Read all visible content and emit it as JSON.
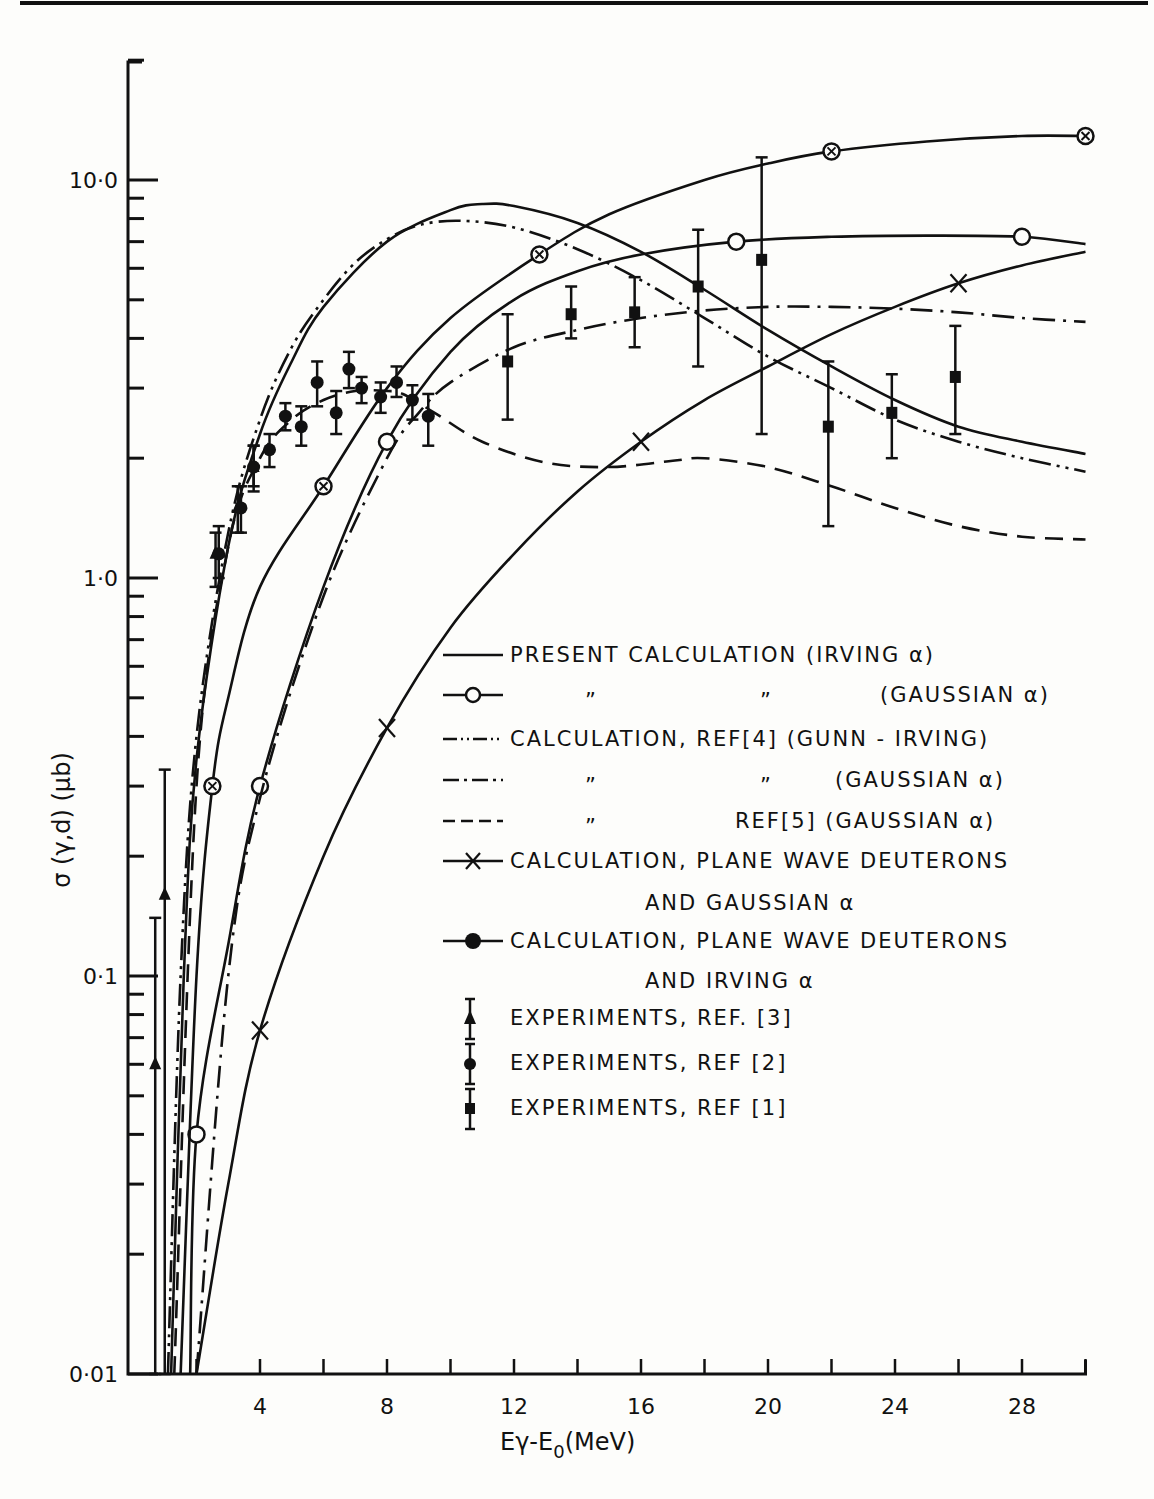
{
  "chart_data": {
    "type": "line",
    "title": "",
    "xlabel": "Eγ-E₀ (MeV)",
    "ylabel": "σ (γ,d) (μb)",
    "xscale": "linear",
    "yscale": "log",
    "xlim": [
      0,
      30
    ],
    "ylim": [
      0.01,
      20
    ],
    "x_ticks": [
      4,
      8,
      12,
      16,
      20,
      24,
      28
    ],
    "x_tick_labels": [
      "4",
      "8",
      "12",
      "16",
      "20",
      "24",
      "28"
    ],
    "y_ticks": [
      0.01,
      0.1,
      1.0,
      10.0
    ],
    "y_tick_labels": [
      "0·01",
      "0·1",
      "1·0",
      "10·0"
    ],
    "grid": false,
    "legend_position": "center-right",
    "series": [
      {
        "name": "PRESENT CALCULATION (IRVING α)",
        "style": "solid",
        "marker": "none",
        "x": [
          1.2,
          1.6,
          2,
          3,
          4,
          5,
          6,
          8,
          10,
          11,
          12,
          14,
          16,
          18,
          20,
          22,
          24,
          26,
          28,
          30
        ],
        "y": [
          0.01,
          0.1,
          0.35,
          1.2,
          2.3,
          3.5,
          4.8,
          7.0,
          8.4,
          8.7,
          8.6,
          7.8,
          6.6,
          5.3,
          4.2,
          3.4,
          2.8,
          2.4,
          2.2,
          2.05
        ]
      },
      {
        "name": "PRESENT CALCULATION (GAUSSIAN α)",
        "style": "solid",
        "marker": "open-circle",
        "x": [
          1.8,
          2,
          3,
          4,
          6,
          8,
          10,
          12,
          14,
          16,
          19,
          22,
          25,
          28,
          30
        ],
        "y": [
          0.01,
          0.04,
          0.12,
          0.3,
          0.95,
          2.2,
          3.7,
          5.0,
          5.9,
          6.5,
          7.0,
          7.2,
          7.25,
          7.2,
          6.9
        ],
        "marker_points": [
          [
            2,
            0.04
          ],
          [
            4,
            0.3
          ],
          [
            8,
            2.2
          ],
          [
            19,
            7.0
          ],
          [
            28,
            7.2
          ]
        ]
      },
      {
        "name": "CALCULATION, REF[4] (GUNN-IRVING)",
        "style": "dash-dot-dot",
        "marker": "none",
        "x": [
          1.1,
          1.5,
          2,
          3,
          4,
          5,
          6,
          7,
          8,
          9,
          10.3,
          12,
          14,
          16,
          18,
          20,
          22,
          24,
          26,
          28,
          30
        ],
        "y": [
          0.01,
          0.1,
          0.4,
          1.3,
          2.5,
          3.8,
          5.0,
          6.2,
          7.1,
          7.7,
          7.9,
          7.6,
          6.7,
          5.6,
          4.5,
          3.6,
          3.0,
          2.5,
          2.2,
          2.0,
          1.85
        ]
      },
      {
        "name": "CALCULATION, REF[4] (GAUSSIAN α)",
        "style": "dash-dot",
        "marker": "none",
        "x": [
          2,
          3,
          4,
          6,
          8,
          9,
          10,
          12,
          14,
          16,
          18,
          20,
          22,
          24,
          26,
          28,
          30
        ],
        "y": [
          0.01,
          0.1,
          0.28,
          0.9,
          2.0,
          2.6,
          3.1,
          3.8,
          4.2,
          4.5,
          4.7,
          4.8,
          4.8,
          4.75,
          4.65,
          4.5,
          4.4
        ]
      },
      {
        "name": "CALCULATION, REF[5] (GAUSSIAN α)",
        "style": "dashed",
        "marker": "none",
        "x": [
          1.3,
          2,
          3,
          4,
          5,
          6,
          7,
          8,
          8.5,
          9.5,
          11,
          13,
          15,
          17,
          18,
          20,
          22,
          24,
          26,
          28,
          30
        ],
        "y": [
          0.01,
          0.3,
          1.2,
          2.0,
          2.5,
          2.8,
          2.95,
          2.95,
          2.9,
          2.6,
          2.2,
          1.95,
          1.9,
          1.97,
          2.0,
          1.9,
          1.7,
          1.5,
          1.35,
          1.27,
          1.25
        ]
      },
      {
        "name": "CALCULATION, PLANE WAVE DEUTERONS AND GAUSSIAN α",
        "style": "solid",
        "marker": "x",
        "x": [
          2,
          3,
          4,
          6,
          8,
          10,
          12,
          14,
          16,
          18,
          20,
          22,
          24,
          26,
          28,
          30
        ],
        "y": [
          0.01,
          0.03,
          0.073,
          0.2,
          0.42,
          0.75,
          1.15,
          1.65,
          2.2,
          2.8,
          3.4,
          4.1,
          4.8,
          5.5,
          6.1,
          6.6
        ],
        "marker_points": [
          [
            4,
            0.073
          ],
          [
            8,
            0.42
          ],
          [
            16,
            2.2
          ],
          [
            26,
            5.5
          ]
        ]
      },
      {
        "name": "CALCULATION, PLANE WAVE DEUTERONS AND IRVING α",
        "style": "solid",
        "marker": "circle-cross",
        "x": [
          1.5,
          2,
          2.5,
          3,
          4,
          6,
          8,
          10,
          12.8,
          15,
          18,
          20,
          22,
          25,
          28,
          30
        ],
        "y": [
          0.01,
          0.1,
          0.3,
          0.5,
          0.95,
          1.7,
          3.0,
          4.5,
          6.5,
          8.2,
          10.0,
          11.0,
          11.8,
          12.5,
          12.9,
          12.9
        ],
        "marker_points": [
          [
            2.5,
            0.3
          ],
          [
            6,
            1.7
          ],
          [
            12.8,
            6.5
          ],
          [
            22,
            11.8
          ],
          [
            30,
            12.9
          ]
        ]
      },
      {
        "name": "EXPERIMENTS, REF. [3]",
        "style": "points",
        "marker": "filled-triangle",
        "points": [
          {
            "x": 0.7,
            "y": 0.06,
            "lo": 0.01,
            "hi": 0.14
          },
          {
            "x": 1.0,
            "y": 0.16,
            "lo": 0.01,
            "hi": 0.33
          },
          {
            "x": 2.6,
            "y": 1.15,
            "lo": 0.95,
            "hi": 1.3
          },
          {
            "x": 3.3,
            "y": 1.5,
            "lo": 1.3,
            "hi": 1.7
          },
          {
            "x": 3.8,
            "y": 1.9,
            "lo": 1.7,
            "hi": 2.15
          }
        ]
      },
      {
        "name": "EXPERIMENTS, REF [2]",
        "style": "points",
        "marker": "filled-circle",
        "points": [
          {
            "x": 2.7,
            "y": 1.15,
            "lo": 1.0,
            "hi": 1.35
          },
          {
            "x": 3.4,
            "y": 1.5,
            "lo": 1.3,
            "hi": 1.7
          },
          {
            "x": 3.8,
            "y": 1.9,
            "lo": 1.65,
            "hi": 2.15
          },
          {
            "x": 4.3,
            "y": 2.1,
            "lo": 1.9,
            "hi": 2.3
          },
          {
            "x": 4.8,
            "y": 2.55,
            "lo": 2.35,
            "hi": 2.75
          },
          {
            "x": 5.3,
            "y": 2.4,
            "lo": 2.15,
            "hi": 2.7
          },
          {
            "x": 5.8,
            "y": 3.1,
            "lo": 2.7,
            "hi": 3.5
          },
          {
            "x": 6.4,
            "y": 2.6,
            "lo": 2.3,
            "hi": 2.95
          },
          {
            "x": 6.8,
            "y": 3.35,
            "lo": 3.0,
            "hi": 3.7
          },
          {
            "x": 7.2,
            "y": 3.0,
            "lo": 2.75,
            "hi": 3.2
          },
          {
            "x": 7.8,
            "y": 2.85,
            "lo": 2.6,
            "hi": 3.1
          },
          {
            "x": 8.3,
            "y": 3.1,
            "lo": 2.85,
            "hi": 3.4
          },
          {
            "x": 8.8,
            "y": 2.8,
            "lo": 2.5,
            "hi": 3.05
          },
          {
            "x": 9.3,
            "y": 2.55,
            "lo": 2.15,
            "hi": 2.9
          }
        ]
      },
      {
        "name": "EXPERIMENTS, REF [1]",
        "style": "points",
        "marker": "filled-square",
        "points": [
          {
            "x": 11.8,
            "y": 3.5,
            "lo": 2.5,
            "hi": 4.6
          },
          {
            "x": 13.8,
            "y": 4.6,
            "lo": 4.0,
            "hi": 5.4
          },
          {
            "x": 15.8,
            "y": 4.65,
            "lo": 3.8,
            "hi": 5.7
          },
          {
            "x": 17.8,
            "y": 5.4,
            "lo": 3.4,
            "hi": 7.5
          },
          {
            "x": 19.8,
            "y": 6.3,
            "lo": 2.3,
            "hi": 11.4
          },
          {
            "x": 21.9,
            "y": 2.4,
            "lo": 1.35,
            "hi": 3.5
          },
          {
            "x": 23.9,
            "y": 2.6,
            "lo": 2.0,
            "hi": 3.25
          },
          {
            "x": 25.9,
            "y": 3.2,
            "lo": 2.3,
            "hi": 4.3
          }
        ]
      }
    ]
  },
  "legend": {
    "items": [
      {
        "text": "PRESENT  CALCULATION (IRVING α)",
        "sample": "solid"
      },
      {
        "text_left": "”",
        "text_mid": "”",
        "text": "(GAUSSIAN α)",
        "sample": "open-circle"
      },
      {
        "text": "CALCULATION, REF[4]  (GUNN - IRVING)",
        "sample": "dash-dot-dot"
      },
      {
        "text_left": "”",
        "text_mid": "”",
        "text": "(GAUSSIAN α)",
        "sample": "dash-dot"
      },
      {
        "text_left": "”",
        "text": "REF[5] (GAUSSIAN α)",
        "sample": "dashed"
      },
      {
        "text": "CALCULATION, PLANE WAVE DEUTERONS",
        "text2": "AND  GAUSSIAN α",
        "sample": "x"
      },
      {
        "text": "CALCULATION, PLANE WAVE DEUTERONS",
        "text2": "AND  IRVING  α",
        "sample": "circle-cross"
      },
      {
        "text": "EXPERIMENTS, REF. [3]",
        "sample": "triangle-errorbar"
      },
      {
        "text": "EXPERIMENTS, REF [2]",
        "sample": "circle-errorbar"
      },
      {
        "text": "EXPERIMENTS, REF [1]",
        "sample": "square-errorbar"
      }
    ]
  },
  "axes": {
    "x_title": "Eγ-E",
    "x_title_sub": "0",
    "x_title_unit": "(MeV)",
    "y_title": "σ (γ,d) (μb)"
  }
}
